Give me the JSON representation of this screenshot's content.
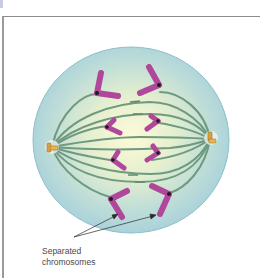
{
  "figure": {
    "label_lines": [
      "Separated",
      "chromosomes"
    ],
    "colors": {
      "cell_outer": "#a9d4dd",
      "cell_inner": "#fbf7d2",
      "spindle": "#6f9a7f",
      "chromosome": "#b0479a",
      "chromosome_stroke": "#7d2a6d",
      "centromere": "#1b1b1b",
      "centrosome": "#d9a240",
      "frame_border": "#8c8c8c",
      "label_text": "#4a4a4a"
    },
    "chromosome_count": 8,
    "centrosome_count": 2
  }
}
